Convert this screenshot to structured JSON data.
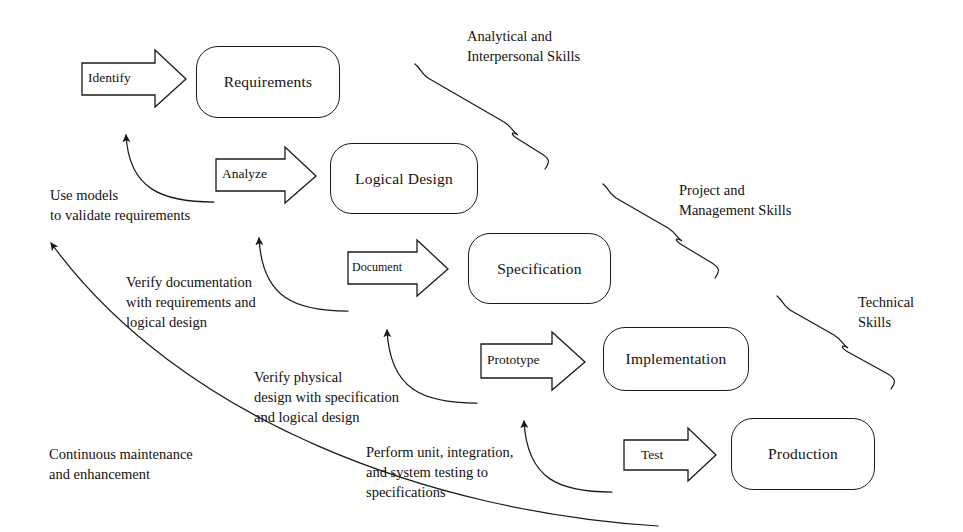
{
  "diagram": {
    "stroke_color": "#1a1a1a",
    "text_color": "#15110f",
    "background": "#ffffff"
  },
  "stages": [
    {
      "id": "requirements",
      "label": "Requirements"
    },
    {
      "id": "logical-design",
      "label": "Logical Design"
    },
    {
      "id": "specification",
      "label": "Specification"
    },
    {
      "id": "implementation",
      "label": "Implementation"
    },
    {
      "id": "production",
      "label": "Production"
    }
  ],
  "transitions": [
    {
      "id": "identify",
      "label": "Identify"
    },
    {
      "id": "analyze",
      "label": "Analyze"
    },
    {
      "id": "document",
      "label": "Document"
    },
    {
      "id": "prototype",
      "label": "Prototype"
    },
    {
      "id": "test",
      "label": "Test"
    }
  ],
  "feedback_notes": [
    {
      "id": "use-models",
      "text": "Use models\nto validate requirements"
    },
    {
      "id": "verify-doc",
      "text": "Verify documentation\nwith requirements and\nlogical design"
    },
    {
      "id": "verify-physical",
      "text": "Verify physical\ndesign with specification\nand logical design"
    },
    {
      "id": "perform-testing",
      "text": "Perform unit, integration,\nand system testing to\nspecifications"
    },
    {
      "id": "continuous",
      "text": "Continuous maintenance\nand enhancement"
    }
  ],
  "skill_groups": [
    {
      "id": "analytical",
      "text": "Analytical and\nInterpersonal Skills"
    },
    {
      "id": "project",
      "text": "Project and\nManagement Skills"
    },
    {
      "id": "technical",
      "text": "Technical\nSkills"
    }
  ]
}
